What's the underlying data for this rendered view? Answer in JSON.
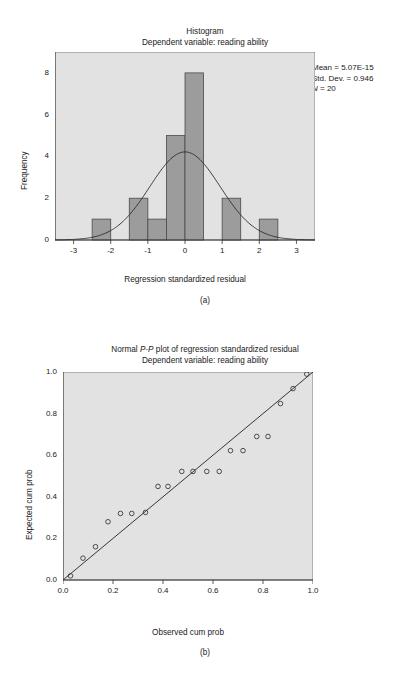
{
  "figure": {
    "header_fragment": "",
    "caption_cut": ""
  },
  "histogram": {
    "panel_letter": "(a)",
    "title_line1": "Histogram",
    "title_line2": "Dependent variable: reading ability",
    "xlabel": "Regression standardized residual",
    "ylabel": "Frequency",
    "xticks": [
      "-3",
      "-2",
      "-1",
      "0",
      "1",
      "2",
      "3"
    ],
    "yticks": [
      "0",
      "2",
      "4",
      "6",
      "8"
    ],
    "stats": {
      "mean": "Mean = 5.07E-15",
      "sd": "Std. Dev. = 0.946",
      "n_symbol": "N",
      "n_value": " = 20"
    },
    "plot_bg": "#e2e2e2",
    "bar_fill": "#9c9c9c",
    "bar_stroke": "#4a4a4a",
    "curve_color": "#2b2b2b"
  },
  "ppplot": {
    "panel_letter": "(b)",
    "title_prefix": "Normal ",
    "title_italic": "P-P",
    "title_suffix": " plot of regression standardized residual",
    "title_line2": "Dependent variable: reading ability",
    "xlabel": "Observed cum prob",
    "ylabel": "Expected cum prob",
    "xticks": [
      "0.0",
      "0.2",
      "0.4",
      "0.6",
      "0.8",
      "1.0"
    ],
    "yticks": [
      "0.0",
      "0.2",
      "0.4",
      "0.6",
      "0.8",
      "1.0"
    ],
    "plot_bg": "#e2e2e2",
    "marker_color": "#333333",
    "line_color": "#222222"
  },
  "chart_data": [
    {
      "type": "bar",
      "title": "Histogram - Dependent variable: reading ability",
      "xlabel": "Regression standardized residual",
      "ylabel": "Frequency",
      "xlim": [
        -3.5,
        3.5
      ],
      "ylim": [
        0,
        9
      ],
      "bin_width": 0.5,
      "categories": [
        "-2.25",
        "-1.25",
        "-0.75",
        "-0.25",
        "0.25",
        "1.25",
        "2.25"
      ],
      "bin_centers": [
        -2.25,
        -1.25,
        -0.75,
        -0.25,
        0.25,
        1.25,
        2.25
      ],
      "values": [
        1,
        2,
        1,
        5,
        8,
        2,
        1
      ],
      "grid": false,
      "legend": "none",
      "annotations": [
        "Mean = 5.07E-15",
        "Std. Dev. = 0.946",
        "N = 20"
      ],
      "overlay": {
        "type": "normal_curve",
        "mean": 0,
        "sd": 0.946,
        "n": 20,
        "peak_frequency": 4.2
      }
    },
    {
      "type": "scatter",
      "title": "Normal P-P plot of regression standardized residual - Dependent variable: reading ability",
      "xlabel": "Observed cum prob",
      "ylabel": "Expected cum prob",
      "xlim": [
        0,
        1
      ],
      "ylim": [
        0,
        1
      ],
      "grid": false,
      "legend": "none",
      "reference_line": {
        "from": [
          0,
          0
        ],
        "to": [
          1,
          1
        ]
      },
      "x": [
        0.03,
        0.08,
        0.13,
        0.18,
        0.23,
        0.275,
        0.33,
        0.38,
        0.42,
        0.475,
        0.52,
        0.575,
        0.625,
        0.67,
        0.72,
        0.775,
        0.82,
        0.87,
        0.92,
        0.975
      ],
      "y": [
        0.02,
        0.105,
        0.16,
        0.28,
        0.32,
        0.32,
        0.325,
        0.45,
        0.45,
        0.522,
        0.522,
        0.522,
        0.522,
        0.622,
        0.622,
        0.69,
        0.69,
        0.848,
        0.92,
        0.99
      ]
    }
  ]
}
